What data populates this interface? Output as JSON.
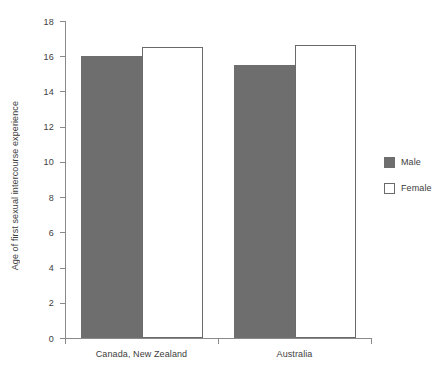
{
  "chart_data": {
    "type": "bar",
    "title": "",
    "subtitle": "",
    "xlabel": "",
    "ylabel": "Age of first sexual intercourse experience",
    "categories": [
      "Canada, New Zealand",
      "Australia"
    ],
    "series": [
      {
        "name": "Male",
        "color": "#6e6e6e",
        "values": [
          16.0,
          15.5
        ]
      },
      {
        "name": "Female",
        "color": "#ffffff",
        "values": [
          16.5,
          16.65
        ]
      }
    ],
    "ylim": [
      0,
      18
    ],
    "yticks": [
      0,
      2,
      4,
      6,
      8,
      10,
      12,
      14,
      16,
      18
    ],
    "ytick_labels": [
      "0",
      "2",
      "4",
      "6",
      "8",
      "10",
      "12",
      "14",
      "16",
      "18"
    ],
    "grid": false,
    "legend": {
      "position": "right",
      "entries": [
        {
          "label": "Male",
          "swatch": "filled-gray-square"
        },
        {
          "label": "Female",
          "swatch": "outlined-white-square"
        }
      ]
    },
    "axis_color": "#8a8a8a",
    "text_color": "#3d3d3d",
    "background": "#ffffff"
  }
}
